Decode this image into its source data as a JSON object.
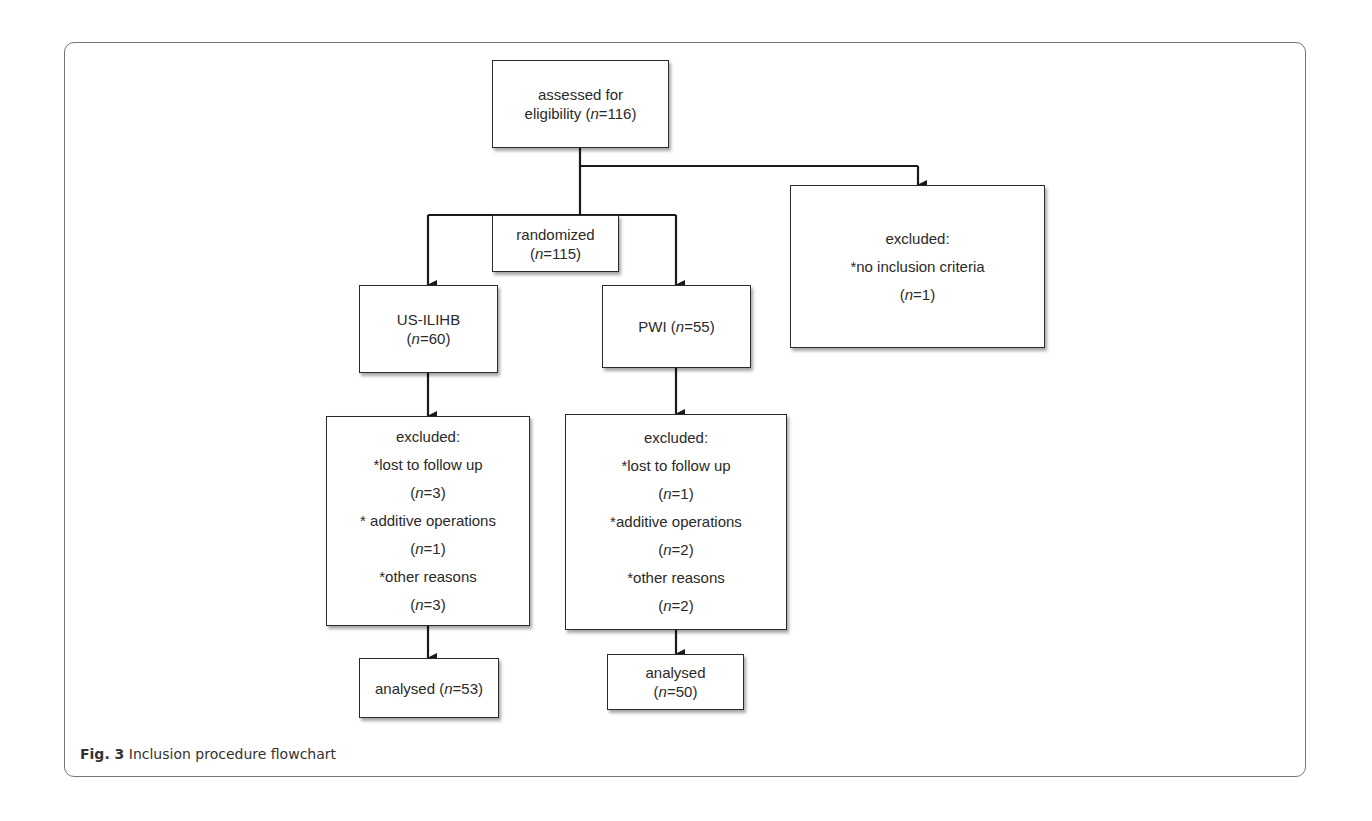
{
  "figure": {
    "label": "Fig. 3",
    "caption": "Inclusion procedure flowchart"
  },
  "nodes": {
    "assessed": {
      "line1": "assessed for",
      "line2_text": "eligibility (",
      "n_label": "n",
      "n_value": "=116)"
    },
    "randomized": {
      "line1": "randomized",
      "n_open": "(",
      "n_label": "n",
      "n_value": "=115)"
    },
    "excluded_initial": {
      "title": "excluded:",
      "reason": "*no inclusion criteria",
      "n_open": "(",
      "n_label": "n",
      "n_value": "=1)"
    },
    "us_ilihb": {
      "line1": "US-ILIHB",
      "n_open": "(",
      "n_label": "n",
      "n_value": "=60)"
    },
    "pwi": {
      "line1_text": "PWI (",
      "n_label": "n",
      "n_value": "=55)"
    },
    "excluded_us": {
      "title": "excluded:",
      "reasons": [
        {
          "label": "*lost to follow up",
          "n_open": "(",
          "n_label": "n",
          "n_value": "=3)"
        },
        {
          "label": "* additive operations",
          "n_open": "(",
          "n_label": "n",
          "n_value": "=1)"
        },
        {
          "label": "*other reasons",
          "n_open": "(",
          "n_label": "n",
          "n_value": "=3)"
        }
      ]
    },
    "excluded_pwi": {
      "title": "excluded:",
      "reasons": [
        {
          "label": "*lost to follow up",
          "n_open": "(",
          "n_label": "n",
          "n_value": "=1)"
        },
        {
          "label": "*additive operations",
          "n_open": "(",
          "n_label": "n",
          "n_value": "=2)"
        },
        {
          "label": "*other reasons",
          "n_open": "(",
          "n_label": "n",
          "n_value": "=2)"
        }
      ]
    },
    "analysed_us": {
      "line1_text": "analysed (",
      "n_label": "n",
      "n_value": "=53)"
    },
    "analysed_pwi": {
      "line1": "analysed",
      "n_open": "(",
      "n_label": "n",
      "n_value": "=50)"
    }
  },
  "colors": {
    "line": "#1a1a1a",
    "box_border": "#2a2a2a",
    "frame": "#777777"
  }
}
